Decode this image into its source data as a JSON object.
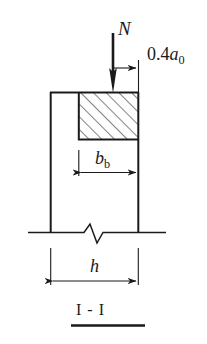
{
  "figure": {
    "name": "column-cross-section-I-I",
    "section_label": "I - I",
    "background_color": "#ffffff",
    "line_color": "#1a1a1a"
  },
  "labels": {
    "load": {
      "symbol": "N",
      "name": "axial-load-label"
    },
    "eccentricity": {
      "prefix": "0.4",
      "symbol": "a",
      "subscript": "0",
      "full_text": "0.4a0",
      "name": "eccentricity-dimension-label"
    },
    "beam_width": {
      "symbol": "b",
      "subscript": "b",
      "full_text": "bb",
      "name": "beam-width-dimension-label"
    },
    "section_depth": {
      "symbol": "h",
      "full_text": "h",
      "name": "section-depth-dimension-label"
    },
    "section_title": {
      "text": "I - I",
      "name": "section-title-label"
    }
  },
  "geometry": {
    "column": {
      "left": 50,
      "right": 139,
      "top": 92,
      "bottom": 232
    },
    "bearing_block": {
      "left": 78,
      "right": 139,
      "top": 92,
      "bottom": 140,
      "hatch_angle_deg": 45,
      "hatch_spacing_px": 9
    },
    "load_arrow": {
      "x": 113,
      "y_start": 33,
      "y_end": 92
    },
    "eccentricity_dimension": {
      "y": 68,
      "x_from": 113,
      "x_to": 139
    },
    "beam_width_dimension": {
      "y": 173,
      "x_from": 78,
      "x_to": 139
    },
    "section_depth_dimension": {
      "y": 281,
      "x_from": 50,
      "x_to": 139
    },
    "break_line": {
      "y": 232,
      "x_from": 28,
      "x_to": 166,
      "zigzag_center_x": 95
    },
    "section_underline": {
      "y": 326,
      "x_from": 71,
      "x_to": 145
    }
  }
}
